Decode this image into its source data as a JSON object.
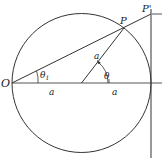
{
  "diagram": {
    "type": "geometry",
    "colors": {
      "stroke": "#333333",
      "text": "#1a1a1a",
      "background": "#ffffff"
    },
    "labels": {
      "origin": "O",
      "point_p": "P",
      "point_p_prime": "P'",
      "theta_1": "θ",
      "theta_1_sub": "1",
      "theta": "θ",
      "radius_label": "a",
      "left_segment": "a",
      "right_segment": "a"
    }
  }
}
